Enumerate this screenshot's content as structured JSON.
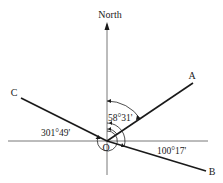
{
  "diagram": {
    "type": "bearing-diagram",
    "north_label": "North",
    "origin_label": "O",
    "points": [
      {
        "name": "A",
        "label": "A",
        "bearing": "58°31'"
      },
      {
        "name": "B",
        "label": "B",
        "bearing": "100°17'"
      },
      {
        "name": "C",
        "label": "C",
        "bearing": "301°49'"
      }
    ],
    "angle_labels": {
      "a": "58°31'",
      "b": "100°17'",
      "c": "301°49'"
    },
    "colors": {
      "line": "#1a1a1a",
      "axis": "#555555",
      "background": "#ffffff"
    }
  }
}
